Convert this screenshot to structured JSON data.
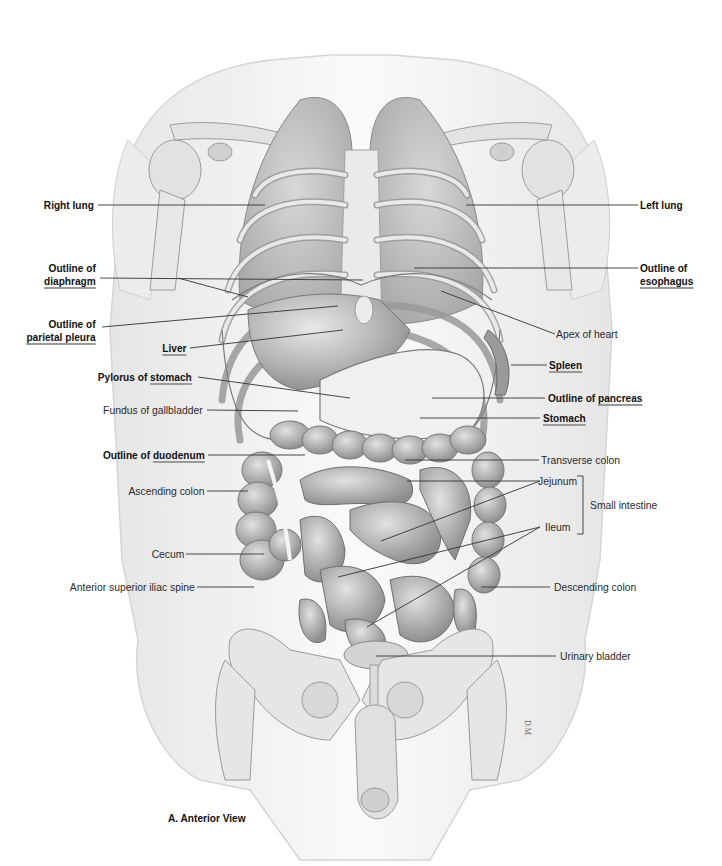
{
  "figure": {
    "caption": "A. Anterior View",
    "signature": "D.M.",
    "colors": {
      "background": "#ffffff",
      "body_outline": "#d9d9d9",
      "skin_shade": "#efefef",
      "bone": "#e4e4e4",
      "organ_dark": "#9e9e9e",
      "organ_mid": "#bdbdbd",
      "leader_line": "#3a3a3a",
      "underline": "#9a9a9a"
    }
  },
  "labels": {
    "right_lung": {
      "text": "Right lung"
    },
    "diaphragm": {
      "line1": "Outline of",
      "line2": "diaphragm"
    },
    "parietal_pleura": {
      "line1": "Outline of",
      "line2": "parietal pleura"
    },
    "liver": {
      "text": "Liver"
    },
    "pylorus": {
      "part1": "Pylorus of ",
      "part2": "stomach"
    },
    "fundus_gallbladder": {
      "text": "Fundus of gallbladder"
    },
    "duodenum": {
      "part1": "Outline of ",
      "part2": "duodenum"
    },
    "ascending_colon": {
      "text": "Ascending colon"
    },
    "cecum": {
      "text": "Cecum"
    },
    "asis": {
      "text": "Anterior superior iliac spine"
    },
    "left_lung": {
      "text": "Left lung"
    },
    "esophagus": {
      "line1": "Outline of",
      "line2": "esophagus"
    },
    "apex_heart": {
      "text": "Apex of heart"
    },
    "spleen": {
      "text": "Spleen"
    },
    "pancreas": {
      "part1": "Outline of ",
      "part2": "pancreas"
    },
    "stomach": {
      "text": "Stomach"
    },
    "transverse_colon": {
      "text": "Transverse colon"
    },
    "jejunum": {
      "text": "Jejunum"
    },
    "ileum": {
      "text": "Ileum"
    },
    "small_intestine": {
      "text": "Small intestine"
    },
    "descending_colon": {
      "text": "Descending colon"
    },
    "urinary_bladder": {
      "text": "Urinary bladder"
    }
  }
}
